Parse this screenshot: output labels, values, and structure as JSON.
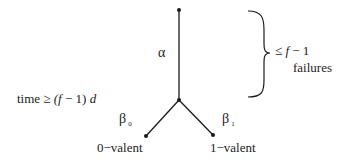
{
  "diagram": {
    "edges": {
      "alpha": {
        "label": "α"
      },
      "beta0": {
        "label": "β",
        "subscript": "0"
      },
      "beta1": {
        "label": "β",
        "subscript": "1"
      }
    },
    "leaves": {
      "left": "0−valent",
      "right": "1−valent"
    },
    "time_annotation": {
      "prefix": "time",
      "relation": "≥",
      "expr_open": "(",
      "f": "f",
      "minus_one": " − 1)",
      "d": "d"
    },
    "brace_annotation": {
      "relation": "≤",
      "f": "f",
      "minus_one": " − 1",
      "caption": "failures"
    },
    "colors": {
      "line": "#1a1a1a",
      "text": "#222222",
      "background": "#ffffff"
    }
  }
}
